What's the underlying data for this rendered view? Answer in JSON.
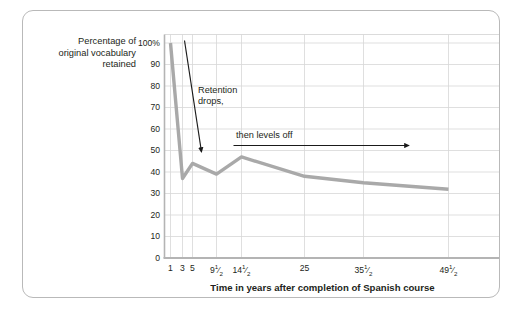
{
  "axis_titles": {
    "y_line1": "Percentage of",
    "y_line2": "original vocabulary",
    "y_line3": "retained",
    "x": "Time in years after completion of Spanish course"
  },
  "annotations": {
    "retention_line1": "Retention",
    "retention_line2": "drops,",
    "levels_off": "then levels off"
  },
  "colors": {
    "line": "#a9a9a9",
    "grid": "#d7d7d7",
    "axis": "#b4b4b4",
    "frame": "#b9b9b9",
    "text": "#231f20",
    "annotation_arrow": "#1a1a1a"
  },
  "chart_data": {
    "type": "line",
    "title": "",
    "xlabel": "Time in years after completion of Spanish course",
    "ylabel": "Percentage of original vocabulary retained",
    "x_tick_labels": [
      "1",
      "3",
      "5",
      "9½",
      "14½",
      "25",
      "35½",
      "49½"
    ],
    "x": [
      1,
      3,
      5,
      9.5,
      14.5,
      25,
      35.5,
      49.5
    ],
    "values": [
      100,
      37,
      44,
      39,
      47,
      38,
      35,
      32
    ],
    "y_tick_labels": [
      "100%",
      "90",
      "80",
      "70",
      "60",
      "50",
      "40",
      "30",
      "20",
      "10",
      "0"
    ],
    "y_ticks": [
      100,
      90,
      80,
      70,
      60,
      50,
      40,
      30,
      20,
      10,
      0
    ],
    "ylim": [
      0,
      104
    ],
    "grid": true,
    "legend": "none",
    "annotations": [
      {
        "text": "Retention drops,",
        "type": "arrow-down"
      },
      {
        "text": "then levels off",
        "type": "arrow-right"
      }
    ]
  }
}
